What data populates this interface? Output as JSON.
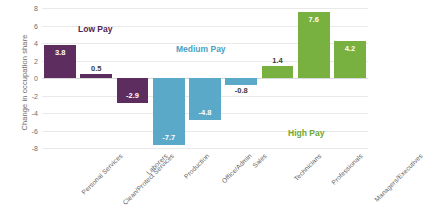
{
  "chart_data": {
    "type": "bar",
    "title": "",
    "subtitle": "",
    "xlabel": "",
    "ylabel": "Change in occupation share",
    "ylim": [
      -8,
      8
    ],
    "ytick_values": [
      8,
      6,
      4,
      2,
      0,
      -2,
      -4,
      -6,
      -8
    ],
    "ytick_labels": [
      "8",
      "6",
      "4",
      "2",
      "0",
      "-2",
      "-4",
      "-6",
      "-8"
    ],
    "grid": true,
    "legend": "none",
    "categories": [
      "Personal Services",
      "Clean/Protect Services",
      "Laborers",
      "Production",
      "Office/Admin",
      "Sales",
      "Technicians",
      "Professionals",
      "Managers/Executives"
    ],
    "values": [
      3.8,
      0.5,
      -2.9,
      -7.7,
      -4.8,
      -0.8,
      1.4,
      7.6,
      4.2
    ],
    "value_labels": [
      "3.8",
      "0.5",
      "-2.9",
      "-7.7",
      "-4.8",
      "-0.8",
      "1.4",
      "7.6",
      "4.2"
    ],
    "bar_colors": [
      "#5c2d5e",
      "#5c2d5e",
      "#5c2d5e",
      "#5aa9c8",
      "#5aa9c8",
      "#5aa9c8",
      "#78b13f",
      "#78b13f",
      "#78b13f"
    ],
    "groups": [
      {
        "name": "Low Pay",
        "color": "#4f2850",
        "members": [
          "Personal Services",
          "Clean/Protect Services",
          "Laborers"
        ]
      },
      {
        "name": "Medium Pay",
        "color": "#4c9fc2",
        "members": [
          "Production",
          "Office/Admin",
          "Sales"
        ]
      },
      {
        "name": "High Pay",
        "color": "#6ea838",
        "members": [
          "Technicians",
          "Professionals",
          "Managers/Executives"
        ]
      }
    ],
    "annotations": [
      {
        "text": "Low Pay",
        "group": "low"
      },
      {
        "text": "Medium Pay",
        "group": "med"
      },
      {
        "text": "High Pay",
        "group": "high"
      }
    ]
  }
}
